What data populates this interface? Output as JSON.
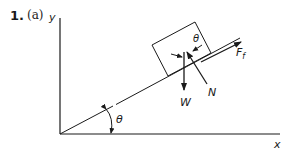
{
  "problem": {
    "number": "1.",
    "part": "(a)"
  },
  "axes": {
    "x_label": "x",
    "y_label": "y"
  },
  "angles": {
    "incline_angle": "θ",
    "block_angle": "θ"
  },
  "forces": {
    "weight": "W",
    "normal": "N",
    "friction": "F",
    "friction_subscript": "f"
  },
  "colors": {
    "ink": "#1a1a1a",
    "background": "#ffffff"
  }
}
